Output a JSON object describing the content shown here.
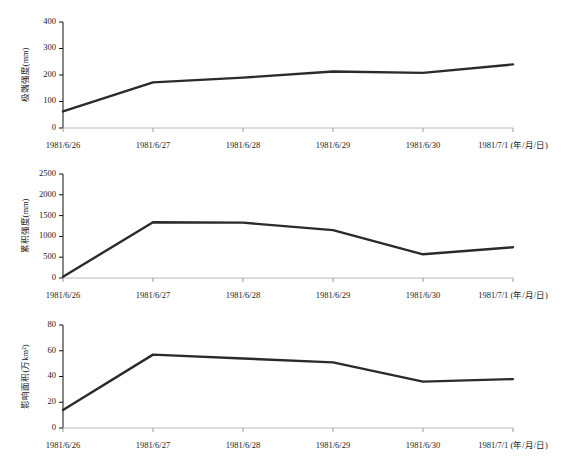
{
  "figure": {
    "background": "#ffffff",
    "line_color": "#2b2b2b",
    "axis_color": "#111111"
  },
  "chart_data": [
    {
      "type": "line",
      "title": "",
      "xlabel": "1981/7/1 (年/月/日)",
      "ylabel": "极端强度(mm)",
      "categories": [
        "1981/6/26",
        "1981/6/27",
        "1981/6/28",
        "1981/6/29",
        "1981/6/30",
        "1981/7/1"
      ],
      "x": [
        "1981/6/26",
        "1981/6/27",
        "1981/6/28",
        "1981/6/29",
        "1981/6/30",
        "1981/7/1"
      ],
      "values": [
        63,
        172,
        190,
        213,
        208,
        240
      ],
      "yticks": [
        0,
        100,
        200,
        300,
        400
      ],
      "ylim": [
        0,
        400
      ],
      "grid": false,
      "legend": "none"
    },
    {
      "type": "line",
      "title": "",
      "xlabel": "1981/7/1 (年/月/日)",
      "ylabel": "累积强度(mm)",
      "categories": [
        "1981/6/26",
        "1981/6/27",
        "1981/6/28",
        "1981/6/29",
        "1981/6/30",
        "1981/7/1"
      ],
      "x": [
        "1981/6/26",
        "1981/6/27",
        "1981/6/28",
        "1981/6/29",
        "1981/6/30",
        "1981/7/1"
      ],
      "values": [
        30,
        1340,
        1330,
        1150,
        570,
        740
      ],
      "yticks": [
        0,
        500,
        1000,
        1500,
        2000,
        2500
      ],
      "ylim": [
        0,
        2500
      ],
      "grid": false,
      "legend": "none"
    },
    {
      "type": "line",
      "title": "",
      "xlabel": "1981/7/1 (年/月/日)",
      "ylabel": "影响面积(万km²)",
      "categories": [
        "1981/6/26",
        "1981/6/27",
        "1981/6/28",
        "1981/6/29",
        "1981/6/30",
        "1981/7/1"
      ],
      "x": [
        "1981/6/26",
        "1981/6/27",
        "1981/6/28",
        "1981/6/29",
        "1981/6/30",
        "1981/7/1"
      ],
      "values": [
        14,
        57,
        54,
        51,
        36,
        38
      ],
      "yticks": [
        0,
        20,
        40,
        60,
        80
      ],
      "ylim": [
        0,
        80
      ],
      "grid": false,
      "legend": "none"
    }
  ],
  "axis_labels": {
    "x_last_with_unit": "1981/7/1 (年/月/日)",
    "x_categories": [
      "1981/6/26",
      "1981/6/27",
      "1981/6/28",
      "1981/6/29",
      "1981/6/30"
    ]
  }
}
